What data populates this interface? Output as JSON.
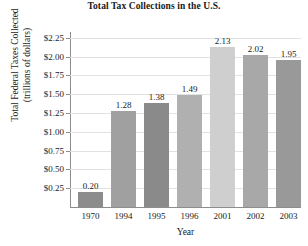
{
  "chart_data": {
    "type": "bar",
    "title": "Total Tax Collections in the U.S.",
    "xlabel": "Year",
    "ylabel": "Total Federal Taxes Collected (trillions of dollars)",
    "ylabel_line1": "Total Federal Taxes Collected",
    "ylabel_line2": "(trillions of dollars)",
    "categories": [
      "1970",
      "1994",
      "1995",
      "1996",
      "2001",
      "2002",
      "2003"
    ],
    "values": [
      0.2,
      1.28,
      1.38,
      1.49,
      2.13,
      2.02,
      1.95
    ],
    "value_labels": [
      "0.20",
      "1.28",
      "1.38",
      "1.49",
      "2.13",
      "2.02",
      "1.95"
    ],
    "bar_colors": [
      "#8c8c8c",
      "#a0a0a0",
      "#8a8a8a",
      "#b0b0b0",
      "#cfcfcf",
      "#a8a8a8",
      "#999999"
    ],
    "ylim": [
      0,
      2.3125
    ],
    "ytick_values": [
      0.25,
      0.5,
      0.75,
      1.0,
      1.25,
      1.5,
      1.75,
      2.0,
      2.25
    ],
    "ytick_labels": [
      "$0.25",
      "$0.50",
      "$0.75",
      "$1.00",
      "$1.25",
      "$1.50",
      "$1.75",
      "$2.00",
      "$2.25"
    ],
    "grid": true,
    "legend": "none",
    "grid_color": "#e2e2e2",
    "axis_color": "#8d8d8d"
  }
}
